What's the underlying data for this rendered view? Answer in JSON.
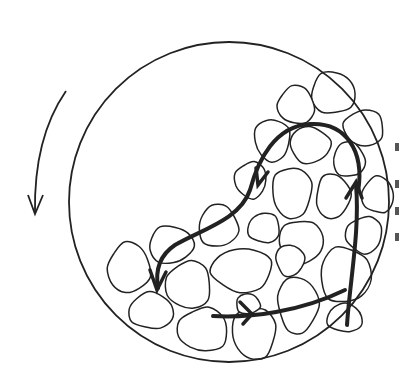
{
  "diagram": {
    "type": "ball-mill-cross-section",
    "colors": {
      "stroke": "#222222",
      "background": "#ffffff"
    },
    "drum": {
      "cx": 229,
      "cy": 202,
      "r": 160
    },
    "rotation_arrow": {
      "direction": "counterclockwise-down"
    },
    "particles": [
      {
        "cx": 333,
        "cy": 93,
        "rx": 22,
        "ry": 21
      },
      {
        "cx": 296,
        "cy": 105,
        "rx": 18,
        "ry": 19
      },
      {
        "cx": 364,
        "cy": 128,
        "rx": 20,
        "ry": 18
      },
      {
        "cx": 272,
        "cy": 140,
        "rx": 18,
        "ry": 21
      },
      {
        "cx": 310,
        "cy": 145,
        "rx": 20,
        "ry": 18
      },
      {
        "cx": 349,
        "cy": 160,
        "rx": 16,
        "ry": 17
      },
      {
        "cx": 378,
        "cy": 195,
        "rx": 16,
        "ry": 18
      },
      {
        "cx": 251,
        "cy": 180,
        "rx": 16,
        "ry": 18
      },
      {
        "cx": 292,
        "cy": 192,
        "rx": 20,
        "ry": 25
      },
      {
        "cx": 333,
        "cy": 196,
        "rx": 17,
        "ry": 22
      },
      {
        "cx": 218,
        "cy": 226,
        "rx": 20,
        "ry": 21
      },
      {
        "cx": 264,
        "cy": 228,
        "rx": 16,
        "ry": 15
      },
      {
        "cx": 364,
        "cy": 235,
        "rx": 18,
        "ry": 18
      },
      {
        "cx": 301,
        "cy": 242,
        "rx": 22,
        "ry": 22
      },
      {
        "cx": 171,
        "cy": 245,
        "rx": 22,
        "ry": 19
      },
      {
        "cx": 129,
        "cy": 268,
        "rx": 21,
        "ry": 25
      },
      {
        "cx": 189,
        "cy": 285,
        "rx": 22,
        "ry": 24
      },
      {
        "cx": 242,
        "cy": 270,
        "rx": 30,
        "ry": 22
      },
      {
        "cx": 290,
        "cy": 260,
        "rx": 14,
        "ry": 16
      },
      {
        "cx": 345,
        "cy": 275,
        "rx": 25,
        "ry": 28
      },
      {
        "cx": 151,
        "cy": 311,
        "rx": 22,
        "ry": 18
      },
      {
        "cx": 203,
        "cy": 330,
        "rx": 25,
        "ry": 22
      },
      {
        "cx": 254,
        "cy": 333,
        "rx": 22,
        "ry": 26
      },
      {
        "cx": 298,
        "cy": 305,
        "rx": 20,
        "ry": 28
      },
      {
        "cx": 248,
        "cy": 304,
        "rx": 12,
        "ry": 10
      },
      {
        "cx": 345,
        "cy": 318,
        "rx": 18,
        "ry": 14
      }
    ]
  }
}
